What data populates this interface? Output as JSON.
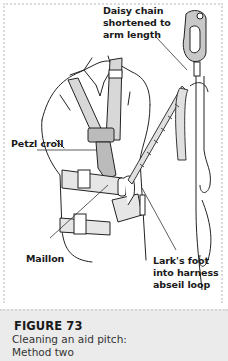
{
  "figure": {
    "labels": {
      "daisy_chain": "Daisy chain shortened to arm length",
      "petzl_croll": "Petzl croll",
      "maillon": "Maillon",
      "larks_foot": "Lark's foot into harness abseil loop"
    },
    "caption": {
      "title": "FIGURE 73",
      "text_line1": "Cleaning an aid pitch:",
      "text_line2": "Method two"
    },
    "colors": {
      "caption_background": "#ebebeb",
      "line_art": "#222222",
      "fill_gray": "#d8d8d8"
    }
  }
}
